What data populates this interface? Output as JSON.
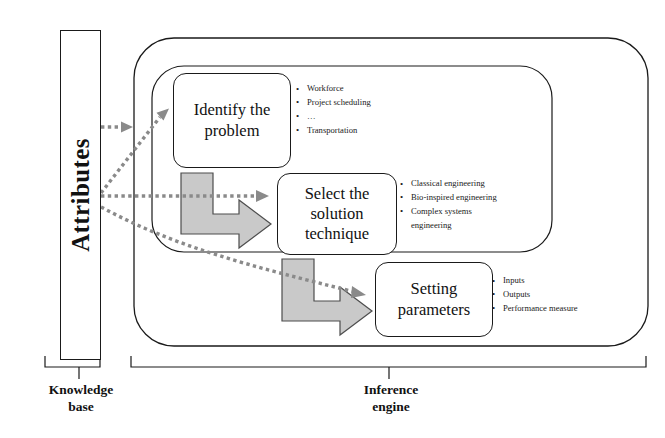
{
  "diagram": {
    "knowledge_base": {
      "attributes_label": "Attributes",
      "caption": "Knowledge\nbase"
    },
    "inference_engine": {
      "caption": "Inference\nengine"
    },
    "steps": [
      {
        "id": "identify",
        "label": "Identify the\nproblem",
        "bullets": [
          "Workforce",
          "Project scheduling",
          "…",
          "Transportation"
        ]
      },
      {
        "id": "select",
        "label": "Select the\nsolution\ntechnique",
        "bullets": [
          "Classical engineering",
          "Bio-inspired engineering",
          "Complex systems\nengineering"
        ]
      },
      {
        "id": "setting",
        "label": "Setting\nparameters",
        "bullets": [
          "Inputs",
          "Outputs",
          "Performance measure"
        ]
      }
    ],
    "colors": {
      "stroke": "#1a1a1a",
      "arrow_fill": "#c9c9c9",
      "arrow_stroke": "#4d4d4d",
      "dotted_arrow": "#8a8a8a",
      "background": "#ffffff"
    }
  }
}
